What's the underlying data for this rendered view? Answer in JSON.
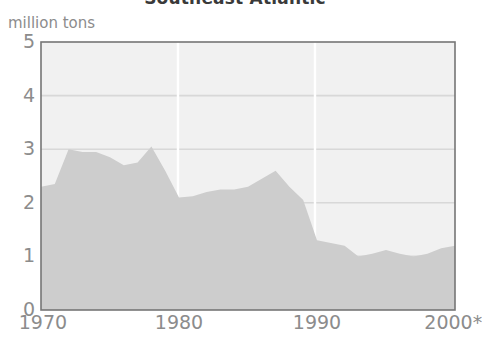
{
  "chart_data": {
    "type": "area",
    "title": "Southeast Atlantic",
    "ylabel": "million tons",
    "xlabel": "",
    "ylim": [
      0,
      5
    ],
    "xlim": [
      1970,
      2000
    ],
    "grid": true,
    "legend": null,
    "y_ticks": [
      5,
      4,
      3,
      2,
      1,
      0
    ],
    "y_tick_labels": [
      "5",
      "4",
      "3",
      "2",
      "1",
      "0"
    ],
    "x_ticks": [
      1970,
      1980,
      1990,
      2000
    ],
    "x_tick_labels": [
      "1970",
      "1980",
      "1990",
      "2000*"
    ],
    "annotations": [
      "* provisional"
    ],
    "series": [
      {
        "name": "Southeast Atlantic catch",
        "x": [
          1970,
          1971,
          1972,
          1973,
          1974,
          1975,
          1976,
          1977,
          1978,
          1979,
          1980,
          1981,
          1982,
          1983,
          1984,
          1985,
          1986,
          1987,
          1988,
          1989,
          1990,
          1991,
          1992,
          1993,
          1994,
          1995,
          1996,
          1997,
          1998,
          1999,
          2000
        ],
        "values": [
          2.3,
          2.35,
          3.0,
          2.95,
          2.95,
          2.85,
          2.7,
          2.75,
          3.05,
          2.6,
          2.1,
          2.12,
          2.2,
          2.25,
          2.25,
          2.3,
          2.45,
          2.6,
          2.3,
          2.05,
          1.3,
          1.25,
          1.2,
          1.0,
          1.05,
          1.12,
          1.05,
          1.0,
          1.05,
          1.15,
          1.2
        ]
      }
    ]
  },
  "colors": {
    "area_fill": "#cdcdcd",
    "plot_background": "#f1f1f1",
    "gridline": "#d8d8d8",
    "frame": "#767676",
    "tick_text": "#8c8c8c",
    "title_text": "#3a3a3a"
  },
  "geometry": {
    "plot_left": 41,
    "plot_right": 455,
    "plot_top": 42,
    "plot_bottom": 310
  }
}
